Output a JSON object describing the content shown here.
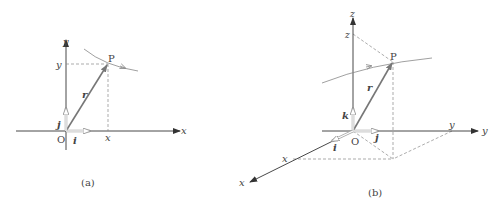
{
  "figure_a": {
    "caption": "(a)",
    "axis_x_label": "x",
    "axis_y_label": "y",
    "origin_label": "O",
    "point_label": "P",
    "vector_r_label": "r",
    "unit_i_label": "i",
    "unit_j_label": "j",
    "proj_x_label": "x",
    "proj_y_label": "y"
  },
  "figure_b": {
    "caption": "(b)",
    "axis_x_label": "x",
    "axis_y_label": "y",
    "axis_z_label": "z",
    "origin_label": "O",
    "point_label": "P",
    "vector_r_label": "r",
    "unit_i_label": "i",
    "unit_j_label": "j",
    "unit_k_label": "k",
    "proj_x_label": "x",
    "proj_y_label": "y",
    "proj_z_label": "z"
  },
  "colors": {
    "axis": "#333333",
    "vector": "#777777",
    "dashed": "#888888",
    "curve": "#888888",
    "text": "#444444"
  }
}
